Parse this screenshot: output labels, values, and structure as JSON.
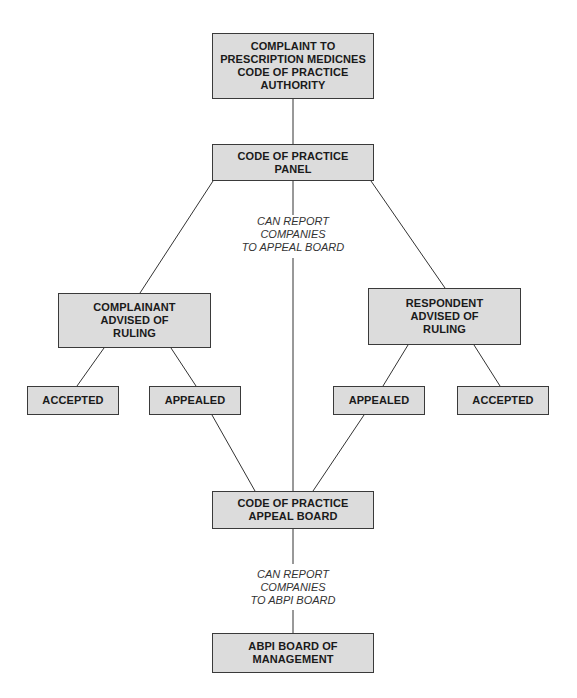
{
  "diagram": {
    "type": "flowchart",
    "nodes": [
      {
        "id": "complaint",
        "label": "COMPLAINT TO\nPRESCRIPTION MEDICNES\nCODE OF PRACTICE\nAUTHORITY"
      },
      {
        "id": "panel",
        "label": "CODE OF PRACTICE\nPANEL"
      },
      {
        "id": "complainant",
        "label": "COMPLAINANT\nADVISED OF\nRULING"
      },
      {
        "id": "respondent",
        "label": "RESPONDENT\nADVISED OF\nRULING"
      },
      {
        "id": "accepted_left",
        "label": "ACCEPTED"
      },
      {
        "id": "appealed_left",
        "label": "APPEALED"
      },
      {
        "id": "appealed_right",
        "label": "APPEALED"
      },
      {
        "id": "accepted_right",
        "label": "ACCEPTED"
      },
      {
        "id": "appeal_board",
        "label": "CODE OF PRACTICE\nAPPEAL BOARD"
      },
      {
        "id": "abpi",
        "label": "ABPI BOARD OF\nMANAGEMENT"
      }
    ],
    "annotations": {
      "panel_to_board": "CAN REPORT\nCOMPANIES\nTO APPEAL BOARD",
      "board_to_abpi": "CAN REPORT\nCOMPANIES\nTO ABPI BOARD"
    },
    "edges": [
      [
        "complaint",
        "panel"
      ],
      [
        "panel",
        "complainant"
      ],
      [
        "panel",
        "respondent"
      ],
      [
        "panel",
        "appeal_board"
      ],
      [
        "complainant",
        "accepted_left"
      ],
      [
        "complainant",
        "appealed_left"
      ],
      [
        "respondent",
        "appealed_right"
      ],
      [
        "respondent",
        "accepted_right"
      ],
      [
        "appealed_left",
        "appeal_board"
      ],
      [
        "appealed_right",
        "appeal_board"
      ],
      [
        "appeal_board",
        "abpi"
      ]
    ],
    "colors": {
      "box_fill": "#dcdcdc",
      "box_border": "#3a3a3a",
      "line": "#333333"
    }
  }
}
